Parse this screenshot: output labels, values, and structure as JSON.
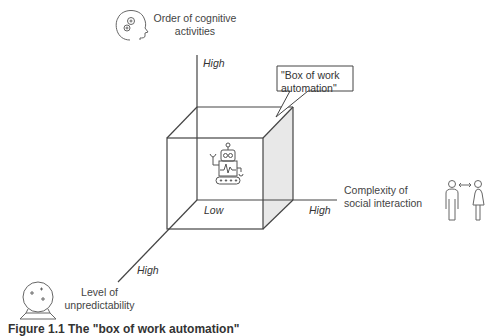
{
  "diagram": {
    "callout": "\"Box of work automation\"",
    "axes": {
      "vertical": {
        "label": "Order of cognitive activities",
        "label_line1": "Order of cognitive",
        "label_line2": "activities",
        "high": "High",
        "icon": "head-gears-icon"
      },
      "horizontal": {
        "label": "Complexity of social interaction",
        "label_line1": "Complexity of",
        "label_line2": "social interaction",
        "high": "High",
        "icon": "people-interaction-icon"
      },
      "diagonal": {
        "label": "Level of unpredictability",
        "label_line1": "Level of",
        "label_line2": "unpredictability",
        "high": "High",
        "icon": "crystal-ball-icon"
      },
      "origin": "Low"
    },
    "center_icon": "robot-icon",
    "colors": {
      "line": "#444444",
      "shade": "#e6e6e6"
    }
  },
  "caption": "Figure 1.1  The \"box of work automation\""
}
